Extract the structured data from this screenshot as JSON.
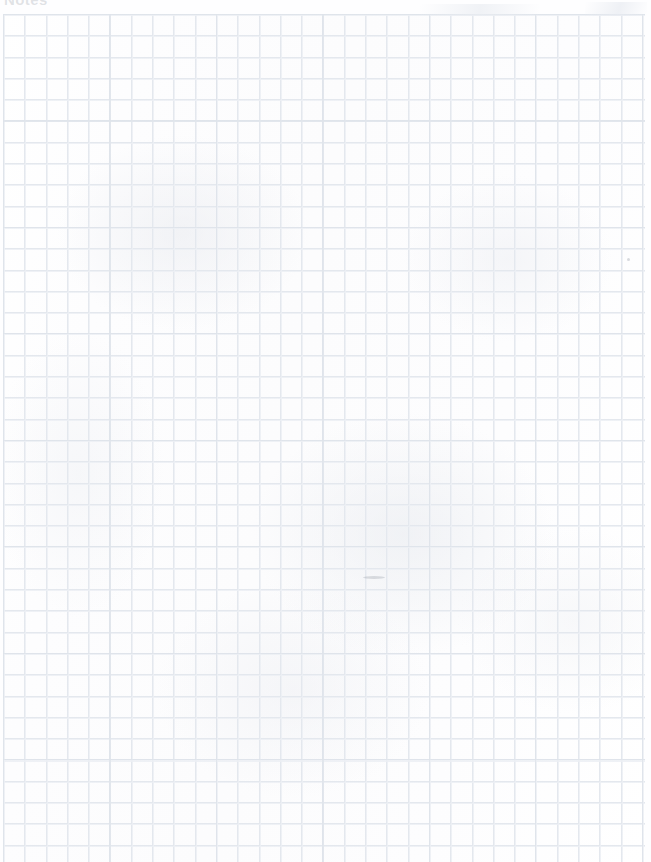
{
  "document": {
    "type": "scanned-grid-paper",
    "title": "Notes",
    "page_width": 651,
    "page_height": 862,
    "background_color": "#fdfdfe",
    "content_text": ""
  },
  "grid": {
    "cell_size_px": 21.3,
    "line_color": "#e4e8ee",
    "major_line_color": "#dee3ea",
    "major_every": 5,
    "offset_left_px": 3,
    "offset_top_px": 14,
    "width_px": 642,
    "height_px": 848,
    "columns": 30,
    "rows": 40
  },
  "artifacts": {
    "speck": {
      "label": "scan-speck",
      "x": 627,
      "y": 258,
      "color": "#a0a5af"
    },
    "smudge": {
      "label": "pencil-smudge",
      "x": 363,
      "y": 576,
      "color": "#969ba5"
    }
  },
  "margins": {
    "left_px": 3,
    "right_px": 6,
    "top_px": 14,
    "bottom_px": 0,
    "color": "#fefeff"
  }
}
